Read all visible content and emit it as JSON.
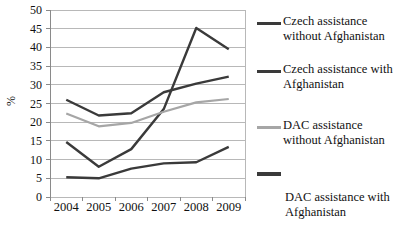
{
  "chart_data": {
    "type": "line",
    "title": "",
    "xlabel": "",
    "ylabel": "%",
    "categories": [
      "2004",
      "2005",
      "2006",
      "2007",
      "2008",
      "2009"
    ],
    "x": [
      2004,
      2005,
      2006,
      2007,
      2008,
      2009
    ],
    "ylim": [
      0,
      50
    ],
    "ytick_step": 5,
    "yticks": [
      "50",
      "45",
      "40",
      "35",
      "30",
      "25",
      "20",
      "15",
      "10",
      "5",
      "0"
    ],
    "grid": "horizontal",
    "legend_position": "right",
    "series": [
      {
        "name": "Czech assistance without Afghanistan",
        "color": "#3a3a3a",
        "values": [
          14.7,
          8.1,
          12.8,
          23.5,
          45.2,
          39.5
        ]
      },
      {
        "name": "Czech assistance with Afghanistan",
        "color": "#3a3a3a",
        "values": [
          26.0,
          21.8,
          22.4,
          28.0,
          30.3,
          32.2
        ]
      },
      {
        "name": "DAC assistance without Afghanistan",
        "color": "#a6a6a6",
        "values": [
          22.3,
          18.9,
          19.8,
          22.8,
          25.3,
          26.2
        ]
      },
      {
        "name": "DAC assistance with Afghanistan",
        "color": "#3a3a3a",
        "values": [
          5.3,
          5.0,
          7.6,
          9.0,
          9.3,
          13.4
        ]
      }
    ]
  },
  "legend": {
    "entries": [
      {
        "label": "Czech assistance without Afghanistan",
        "swatch_color": "#3a3a3a",
        "swatch_style": "dark"
      },
      {
        "label": "Czech assistance with Afghanistan",
        "swatch_color": "#3a3a3a",
        "swatch_style": "dark"
      },
      {
        "label": "DAC assistance without Afghanistan",
        "swatch_color": "#a6a6a6",
        "swatch_style": "light"
      },
      {
        "label": "DAC assistance with Afghanistan",
        "swatch_color": "#3a3a3a",
        "swatch_style": "thick"
      }
    ]
  },
  "axes": {
    "y_unit_label": "%",
    "y_labels": [
      "50",
      "45",
      "40",
      "35",
      "30",
      "25",
      "20",
      "15",
      "10",
      "5",
      "0"
    ],
    "x_labels": [
      "2004",
      "2005",
      "2006",
      "2007",
      "2008",
      "2009"
    ]
  },
  "colors": {
    "dark_line": "#3a3a3a",
    "light_line": "#a6a6a6",
    "grid": "#b8b8b8",
    "axis": "#8a8a8a",
    "background": "#ffffff",
    "text": "#111111"
  }
}
